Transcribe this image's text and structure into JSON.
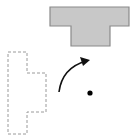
{
  "diagram": {
    "type": "rotation-transformation",
    "background": "#ffffff",
    "image_shape": {
      "label": "rotated-figure",
      "fill": "#c8c8c8",
      "stroke": "#8a8a8a",
      "points": "50,7 129,7 129,26 110,26 110,46 71,46 71,26 50,26"
    },
    "preimage_shape": {
      "label": "original-figure",
      "stroke": "#9a9a9a",
      "dash": "3,2",
      "points": "8,52 27,52 27,73 46,73 46,112 27,112 27,134 8,134"
    },
    "rotation_arrow": {
      "stroke": "#111111",
      "path": "M 59 92 Q 62 68 86 61",
      "head": "90,60 80,57 83,66"
    },
    "center_point": {
      "cx": 90,
      "cy": 93,
      "r": 2.6,
      "fill": "#000000"
    }
  }
}
